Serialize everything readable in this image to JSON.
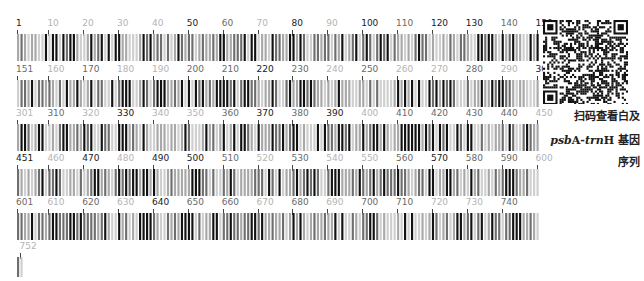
{
  "figure": {
    "type": "dna-barcode",
    "total_length": 752,
    "bases_per_row": 150,
    "colors": {
      "dark": "#1a1a1a",
      "mid": "#6a6a6a",
      "light": "#b4b4b4",
      "bar_dark": "#111111",
      "bar_gray": "#8a8a8a",
      "bar_light": "#c8c8c8"
    }
  },
  "rows": [
    {
      "start": 1,
      "end": 150,
      "labels": [
        {
          "text": "1",
          "pos": 1,
          "tone": 0
        },
        {
          "text": "10",
          "pos": 10,
          "tone": 2
        },
        {
          "text": "20",
          "pos": 20,
          "tone": 2
        },
        {
          "text": "30",
          "pos": 30,
          "tone": 2
        },
        {
          "text": "40",
          "pos": 40,
          "tone": 2
        },
        {
          "text": "50",
          "pos": 50,
          "tone": 0
        },
        {
          "text": "60",
          "pos": 60,
          "tone": 1
        },
        {
          "text": "70",
          "pos": 70,
          "tone": 2
        },
        {
          "text": "80",
          "pos": 80,
          "tone": 0
        },
        {
          "text": "90",
          "pos": 90,
          "tone": 2
        },
        {
          "text": "100",
          "pos": 100,
          "tone": 0
        },
        {
          "text": "110",
          "pos": 110,
          "tone": 1
        },
        {
          "text": "120",
          "pos": 120,
          "tone": 0
        },
        {
          "text": "130",
          "pos": 130,
          "tone": 0
        },
        {
          "text": "140",
          "pos": 140,
          "tone": 1
        },
        {
          "text": "150",
          "pos": 150,
          "tone": 0
        }
      ]
    },
    {
      "start": 151,
      "end": 300,
      "labels": [
        {
          "text": "151",
          "pos": 151,
          "tone": 1
        },
        {
          "text": "160",
          "pos": 160,
          "tone": 2
        },
        {
          "text": "170",
          "pos": 170,
          "tone": 1
        },
        {
          "text": "180",
          "pos": 180,
          "tone": 2
        },
        {
          "text": "190",
          "pos": 190,
          "tone": 2
        },
        {
          "text": "200",
          "pos": 200,
          "tone": 1
        },
        {
          "text": "210",
          "pos": 210,
          "tone": 1
        },
        {
          "text": "220",
          "pos": 220,
          "tone": 0
        },
        {
          "text": "230",
          "pos": 230,
          "tone": 1
        },
        {
          "text": "240",
          "pos": 240,
          "tone": 2
        },
        {
          "text": "250",
          "pos": 250,
          "tone": 1
        },
        {
          "text": "260",
          "pos": 260,
          "tone": 2
        },
        {
          "text": "270",
          "pos": 270,
          "tone": 2
        },
        {
          "text": "280",
          "pos": 280,
          "tone": 1
        },
        {
          "text": "290",
          "pos": 290,
          "tone": 2
        },
        {
          "text": "300",
          "pos": 300,
          "tone": 0
        }
      ]
    },
    {
      "start": 301,
      "end": 450,
      "labels": [
        {
          "text": "301",
          "pos": 301,
          "tone": 2
        },
        {
          "text": "310",
          "pos": 310,
          "tone": 1
        },
        {
          "text": "320",
          "pos": 320,
          "tone": 2
        },
        {
          "text": "330",
          "pos": 330,
          "tone": 0
        },
        {
          "text": "340",
          "pos": 340,
          "tone": 2
        },
        {
          "text": "350",
          "pos": 350,
          "tone": 2
        },
        {
          "text": "360",
          "pos": 360,
          "tone": 1
        },
        {
          "text": "370",
          "pos": 370,
          "tone": 0
        },
        {
          "text": "380",
          "pos": 380,
          "tone": 1
        },
        {
          "text": "390",
          "pos": 390,
          "tone": 0
        },
        {
          "text": "400",
          "pos": 400,
          "tone": 2
        },
        {
          "text": "410",
          "pos": 410,
          "tone": 1
        },
        {
          "text": "420",
          "pos": 420,
          "tone": 1
        },
        {
          "text": "430",
          "pos": 430,
          "tone": 1
        },
        {
          "text": "440",
          "pos": 440,
          "tone": 1
        },
        {
          "text": "450",
          "pos": 450,
          "tone": 2
        }
      ]
    },
    {
      "start": 451,
      "end": 600,
      "labels": [
        {
          "text": "451",
          "pos": 451,
          "tone": 0
        },
        {
          "text": "460",
          "pos": 460,
          "tone": 2
        },
        {
          "text": "470",
          "pos": 470,
          "tone": 0
        },
        {
          "text": "480",
          "pos": 480,
          "tone": 2
        },
        {
          "text": "490",
          "pos": 490,
          "tone": 0
        },
        {
          "text": "500",
          "pos": 500,
          "tone": 0
        },
        {
          "text": "510",
          "pos": 510,
          "tone": 1
        },
        {
          "text": "520",
          "pos": 520,
          "tone": 2
        },
        {
          "text": "530",
          "pos": 530,
          "tone": 1
        },
        {
          "text": "540",
          "pos": 540,
          "tone": 2
        },
        {
          "text": "550",
          "pos": 550,
          "tone": 2
        },
        {
          "text": "560",
          "pos": 560,
          "tone": 1
        },
        {
          "text": "570",
          "pos": 570,
          "tone": 0
        },
        {
          "text": "580",
          "pos": 580,
          "tone": 1
        },
        {
          "text": "590",
          "pos": 590,
          "tone": 1
        },
        {
          "text": "600",
          "pos": 600,
          "tone": 2
        }
      ]
    },
    {
      "start": 601,
      "end": 750,
      "labels": [
        {
          "text": "601",
          "pos": 601,
          "tone": 1
        },
        {
          "text": "610",
          "pos": 610,
          "tone": 2
        },
        {
          "text": "620",
          "pos": 620,
          "tone": 1
        },
        {
          "text": "630",
          "pos": 630,
          "tone": 2
        },
        {
          "text": "640",
          "pos": 640,
          "tone": 0
        },
        {
          "text": "650",
          "pos": 650,
          "tone": 1
        },
        {
          "text": "660",
          "pos": 660,
          "tone": 1
        },
        {
          "text": "670",
          "pos": 670,
          "tone": 2
        },
        {
          "text": "680",
          "pos": 680,
          "tone": 1
        },
        {
          "text": "690",
          "pos": 690,
          "tone": 2
        },
        {
          "text": "700",
          "pos": 700,
          "tone": 1
        },
        {
          "text": "710",
          "pos": 710,
          "tone": 1
        },
        {
          "text": "720",
          "pos": 720,
          "tone": 2
        },
        {
          "text": "730",
          "pos": 730,
          "tone": 2
        },
        {
          "text": "740",
          "pos": 740,
          "tone": 1
        }
      ]
    },
    {
      "start": 751,
      "end": 752,
      "labels": [
        {
          "text": "752",
          "pos": 752,
          "tone": 2
        }
      ]
    }
  ],
  "qr": {
    "label": "qr-code"
  },
  "caption": {
    "line1": "扫码查看白及",
    "line2_italic": "psb",
    "line2_a": "A-",
    "line2_italic2": "trn",
    "line2_b": "H 基因",
    "line3": "序列"
  }
}
